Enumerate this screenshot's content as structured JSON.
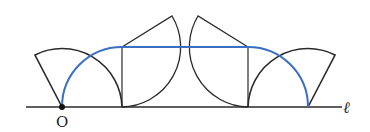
{
  "diagram": {
    "type": "rolling-square-locus",
    "labels": {
      "origin": "O",
      "line": "ℓ"
    },
    "colors": {
      "stroke": "#2a2a2a",
      "locus": "#3a6fc4",
      "background": "#ffffff"
    }
  }
}
